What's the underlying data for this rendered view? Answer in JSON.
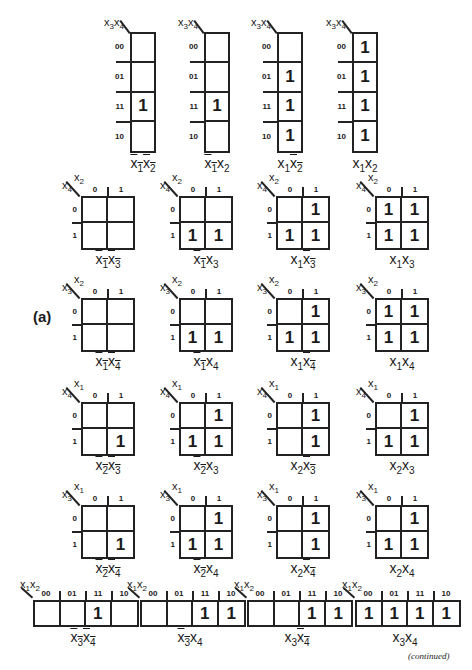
{
  "part_label": "(a)",
  "footer": {
    "continued": "(continued)"
  },
  "colors": {
    "ink": "#222222",
    "background": "#ffffff"
  },
  "row_labels_4": [
    "00",
    "01",
    "11",
    "10"
  ],
  "col_labels_2": [
    "0",
    "1"
  ],
  "row_labels_2": [
    "0",
    "1"
  ],
  "col_labels_4": [
    "00",
    "01",
    "11",
    "10"
  ],
  "maps_4x1": [
    {
      "corner": [
        "x3",
        "x4"
      ],
      "caption": [
        {
          "v": "x1",
          "bar": true
        },
        {
          "v": "x2",
          "bar": true
        }
      ],
      "cells": [
        "",
        "",
        "1",
        ""
      ]
    },
    {
      "corner": [
        "x3",
        "x4"
      ],
      "caption": [
        {
          "v": "x1",
          "bar": true
        },
        {
          "v": "x2",
          "bar": false
        }
      ],
      "cells": [
        "",
        "",
        "1",
        ""
      ]
    },
    {
      "corner": [
        "x3",
        "x4"
      ],
      "caption": [
        {
          "v": "x1",
          "bar": false
        },
        {
          "v": "x2",
          "bar": true
        }
      ],
      "cells": [
        "",
        "1",
        "1",
        "1"
      ]
    },
    {
      "corner": [
        "x3",
        "x4"
      ],
      "caption": [
        {
          "v": "x1",
          "bar": false
        },
        {
          "v": "x2",
          "bar": false
        }
      ],
      "cells": [
        "1",
        "1",
        "1",
        "1"
      ]
    }
  ],
  "maps_2x2": [
    [
      {
        "top": "x2",
        "left": "x4",
        "caption": [
          {
            "v": "x1",
            "bar": true
          },
          {
            "v": "x3",
            "bar": true
          }
        ],
        "cells": [
          [
            "",
            ""
          ],
          [
            "",
            ""
          ]
        ]
      },
      {
        "top": "x2",
        "left": "x4",
        "caption": [
          {
            "v": "x1",
            "bar": true
          },
          {
            "v": "x3",
            "bar": false
          }
        ],
        "cells": [
          [
            "",
            ""
          ],
          [
            "1",
            "1"
          ]
        ]
      },
      {
        "top": "x2",
        "left": "x4",
        "caption": [
          {
            "v": "x1",
            "bar": false
          },
          {
            "v": "x3",
            "bar": true
          }
        ],
        "cells": [
          [
            "",
            "1"
          ],
          [
            "1",
            "1"
          ]
        ]
      },
      {
        "top": "x2",
        "left": "x4",
        "caption": [
          {
            "v": "x1",
            "bar": false
          },
          {
            "v": "x3",
            "bar": false
          }
        ],
        "cells": [
          [
            "1",
            "1"
          ],
          [
            "1",
            "1"
          ]
        ]
      }
    ],
    [
      {
        "top": "x2",
        "left": "x3",
        "caption": [
          {
            "v": "x1",
            "bar": true
          },
          {
            "v": "x4",
            "bar": true
          }
        ],
        "cells": [
          [
            "",
            ""
          ],
          [
            "",
            ""
          ]
        ]
      },
      {
        "top": "x2",
        "left": "x3",
        "caption": [
          {
            "v": "x1",
            "bar": true
          },
          {
            "v": "x4",
            "bar": false
          }
        ],
        "cells": [
          [
            "",
            ""
          ],
          [
            "1",
            "1"
          ]
        ]
      },
      {
        "top": "x2",
        "left": "x3",
        "caption": [
          {
            "v": "x1",
            "bar": false
          },
          {
            "v": "x4",
            "bar": true
          }
        ],
        "cells": [
          [
            "",
            "1"
          ],
          [
            "1",
            "1"
          ]
        ]
      },
      {
        "top": "x2",
        "left": "x3",
        "caption": [
          {
            "v": "x1",
            "bar": false
          },
          {
            "v": "x4",
            "bar": false
          }
        ],
        "cells": [
          [
            "1",
            "1"
          ],
          [
            "1",
            "1"
          ]
        ]
      }
    ],
    [
      {
        "top": "x1",
        "left": "x4",
        "caption": [
          {
            "v": "x2",
            "bar": true
          },
          {
            "v": "x3",
            "bar": true
          }
        ],
        "cells": [
          [
            "",
            ""
          ],
          [
            "",
            "1"
          ]
        ]
      },
      {
        "top": "x1",
        "left": "x4",
        "caption": [
          {
            "v": "x2",
            "bar": true
          },
          {
            "v": "x3",
            "bar": false
          }
        ],
        "cells": [
          [
            "",
            "1"
          ],
          [
            "1",
            "1"
          ]
        ]
      },
      {
        "top": "x1",
        "left": "x4",
        "caption": [
          {
            "v": "x2",
            "bar": false
          },
          {
            "v": "x3",
            "bar": true
          }
        ],
        "cells": [
          [
            "",
            "1"
          ],
          [
            "",
            "1"
          ]
        ]
      },
      {
        "top": "x1",
        "left": "x4",
        "caption": [
          {
            "v": "x2",
            "bar": false
          },
          {
            "v": "x3",
            "bar": false
          }
        ],
        "cells": [
          [
            "",
            "1"
          ],
          [
            "1",
            "1"
          ]
        ]
      }
    ],
    [
      {
        "top": "x1",
        "left": "x3",
        "caption": [
          {
            "v": "x2",
            "bar": true
          },
          {
            "v": "x4",
            "bar": true
          }
        ],
        "cells": [
          [
            "",
            ""
          ],
          [
            "",
            "1"
          ]
        ]
      },
      {
        "top": "x1",
        "left": "x3",
        "caption": [
          {
            "v": "x2",
            "bar": true
          },
          {
            "v": "x4",
            "bar": false
          }
        ],
        "cells": [
          [
            "",
            "1"
          ],
          [
            "1",
            "1"
          ]
        ]
      },
      {
        "top": "x1",
        "left": "x3",
        "caption": [
          {
            "v": "x2",
            "bar": false
          },
          {
            "v": "x4",
            "bar": true
          }
        ],
        "cells": [
          [
            "",
            "1"
          ],
          [
            "",
            "1"
          ]
        ]
      },
      {
        "top": "x1",
        "left": "x3",
        "caption": [
          {
            "v": "x2",
            "bar": false
          },
          {
            "v": "x4",
            "bar": false
          }
        ],
        "cells": [
          [
            "",
            "1"
          ],
          [
            "1",
            "1"
          ]
        ]
      }
    ]
  ],
  "maps_1x4": [
    {
      "corner": [
        "x1",
        "x2"
      ],
      "caption": [
        {
          "v": "x3",
          "bar": true
        },
        {
          "v": "x4",
          "bar": true
        }
      ],
      "cells": [
        "",
        "",
        "1",
        ""
      ]
    },
    {
      "corner": [
        "x1",
        "x2"
      ],
      "caption": [
        {
          "v": "x3",
          "bar": true
        },
        {
          "v": "x4",
          "bar": false
        }
      ],
      "cells": [
        "",
        "",
        "1",
        "1"
      ]
    },
    {
      "corner": [
        "x1",
        "x2"
      ],
      "caption": [
        {
          "v": "x3",
          "bar": false
        },
        {
          "v": "x4",
          "bar": true
        }
      ],
      "cells": [
        "",
        "",
        "1",
        "1"
      ]
    },
    {
      "corner": [
        "x1",
        "x2"
      ],
      "caption": [
        {
          "v": "x3",
          "bar": false
        },
        {
          "v": "x4",
          "bar": false
        }
      ],
      "cells": [
        "1",
        "1",
        "1",
        "1"
      ]
    }
  ]
}
